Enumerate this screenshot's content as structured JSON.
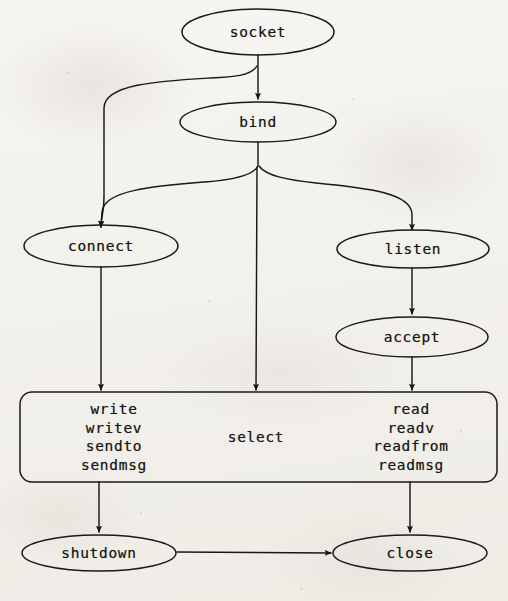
{
  "diagram": {
    "background_color": "#f3f1ec",
    "ink_color": "#161513",
    "nodes": [
      {
        "id": "socket",
        "label": "socket",
        "shape": "ellipse",
        "cx": 258,
        "cy": 32,
        "rx": 76,
        "ry": 23
      },
      {
        "id": "bind",
        "label": "bind",
        "shape": "ellipse",
        "cx": 258,
        "cy": 122,
        "rx": 78,
        "ry": 20
      },
      {
        "id": "connect",
        "label": "connect",
        "shape": "ellipse",
        "cx": 101,
        "cy": 246,
        "rx": 77,
        "ry": 21
      },
      {
        "id": "listen",
        "label": "listen",
        "shape": "ellipse",
        "cx": 413,
        "cy": 249,
        "rx": 76,
        "ry": 19
      },
      {
        "id": "accept",
        "label": "accept",
        "shape": "ellipse",
        "cx": 412,
        "cy": 337,
        "rx": 76,
        "ry": 20
      },
      {
        "id": "shutdown",
        "label": "shutdown",
        "shape": "ellipse",
        "cx": 99,
        "cy": 553,
        "rx": 77,
        "ry": 18
      },
      {
        "id": "close",
        "label": "close",
        "shape": "ellipse",
        "cx": 410,
        "cy": 553,
        "rx": 77,
        "ry": 18
      }
    ],
    "io_box": {
      "id": "io-box",
      "shape": "rounded-rect",
      "x": 20,
      "y": 392,
      "width": 477,
      "height": 90,
      "radius": 12,
      "columns": [
        {
          "id": "write-column",
          "cx": 114,
          "lines": [
            "write",
            "writev",
            "sendto",
            "sendmsg"
          ]
        },
        {
          "id": "select-column",
          "cx": 256,
          "lines": [
            "select"
          ]
        },
        {
          "id": "read-column",
          "cx": 411,
          "lines": [
            "read",
            "readv",
            "readfrom",
            "readmsg"
          ]
        }
      ]
    },
    "edges": [
      {
        "id": "socket-to-bind",
        "from": "socket",
        "to": "bind",
        "style": "straight"
      },
      {
        "id": "socket-to-connect",
        "from": "socket",
        "to": "connect",
        "style": "curved-left"
      },
      {
        "id": "bind-to-connect",
        "from": "bind",
        "to": "connect",
        "style": "curved-left"
      },
      {
        "id": "bind-to-listen",
        "from": "bind",
        "to": "listen",
        "style": "curved-right"
      },
      {
        "id": "bind-to-select",
        "from": "bind",
        "to": "select-column",
        "style": "straight"
      },
      {
        "id": "connect-to-write",
        "from": "connect",
        "to": "write-column",
        "style": "straight"
      },
      {
        "id": "listen-to-accept",
        "from": "listen",
        "to": "accept",
        "style": "straight"
      },
      {
        "id": "accept-to-read",
        "from": "accept",
        "to": "read-column",
        "style": "straight"
      },
      {
        "id": "write-to-shutdown",
        "from": "write-column",
        "to": "shutdown",
        "style": "straight"
      },
      {
        "id": "read-to-close",
        "from": "read-column",
        "to": "close",
        "style": "straight"
      },
      {
        "id": "shutdown-to-close",
        "from": "shutdown",
        "to": "close",
        "style": "horizontal"
      }
    ]
  }
}
